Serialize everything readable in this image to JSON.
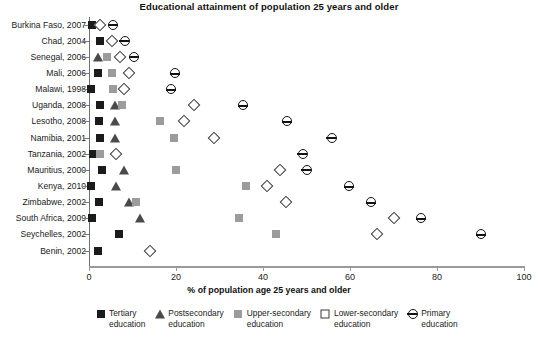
{
  "chart_data": {
    "type": "scatter",
    "title": "Educational attainment of population 25 years and older",
    "xlabel": "% of population age 25 years and older",
    "ylabel": "",
    "xlim": [
      0,
      100
    ],
    "xticks": [
      0,
      20,
      40,
      60,
      80,
      100
    ],
    "grid": false,
    "legend_position": "bottom",
    "categories": [
      "Burkina Faso, 2007",
      "Chad, 2004",
      "Senegal, 2006",
      "Mali, 2006",
      "Malawi, 1998",
      "Uganda, 2008",
      "Lesotho, 2008",
      "Namibia, 2001",
      "Tanzania, 2002",
      "Mauritius, 2000",
      "Kenya, 2010",
      "Zimbabwe, 2002",
      "South Africa, 2009",
      "Seychelles, 2002",
      "Benin, 2002"
    ],
    "series": [
      {
        "name": "Tertiary education",
        "marker": "filled-square",
        "color": "#1b1b1b",
        "values": [
          0.6,
          2.6,
          null,
          2.0,
          0.4,
          2.6,
          2.4,
          2.5,
          0.9,
          3.1,
          0.5,
          2.2,
          0.8,
          6.9,
          2.1
        ]
      },
      {
        "name": "Postsecondary education",
        "marker": "filled-triangle",
        "color": "#4a4a4a",
        "values": [
          null,
          null,
          2.1,
          null,
          null,
          6.0,
          5.9,
          6.0,
          null,
          8.0,
          6.1,
          9.1,
          11.8,
          null,
          null
        ]
      },
      {
        "name": "Upper-secondary education",
        "marker": "gray-square",
        "color": "#9c9c9c",
        "values": [
          null,
          null,
          4.1,
          5.4,
          5.5,
          7.6,
          16.4,
          19.5,
          2.6,
          20.0,
          36.2,
          10.9,
          34.4,
          43.1,
          null
        ]
      },
      {
        "name": "Lower-secondary education",
        "marker": "open-diamond",
        "color": "#3a3a3a",
        "values": [
          2.6,
          5.2,
          7.2,
          9.3,
          8.1,
          24.1,
          21.9,
          28.7,
          6.2,
          44.0,
          41.0,
          45.2,
          70.1,
          66.2,
          14.0
        ]
      },
      {
        "name": "Primary education",
        "marker": "half-circle",
        "color": "#121212",
        "values": [
          5.5,
          8.2,
          10.4,
          19.8,
          18.9,
          35.5,
          45.6,
          55.8,
          49.1,
          50.0,
          59.8,
          64.8,
          76.4,
          90.2,
          null
        ]
      }
    ]
  },
  "legend": {
    "items": [
      {
        "line1": "Tertiary",
        "line2": "education",
        "marker": "filled-square"
      },
      {
        "line1": "Postsecondary",
        "line2": "education",
        "marker": "filled-triangle"
      },
      {
        "line1": "Upper-secondary",
        "line2": "education",
        "marker": "gray-square"
      },
      {
        "line1": "Lower-secondary",
        "line2": "education",
        "marker": "open-diamond"
      },
      {
        "line1": "Primary",
        "line2": "education",
        "marker": "half-circle"
      }
    ]
  }
}
